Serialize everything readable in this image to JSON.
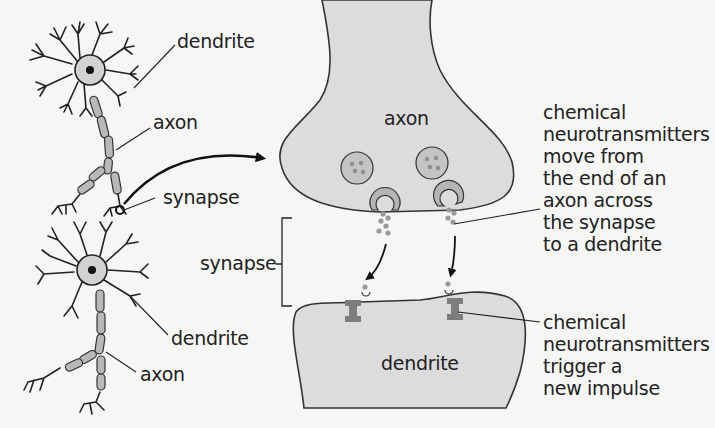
{
  "diagram": {
    "title_fragment": "",
    "labels": {
      "dendrite_top": "dendrite",
      "axon_top": "axon",
      "synapse_left": "synapse",
      "synapse_bracket": "synapse",
      "dendrite_bottom": "dendrite",
      "axon_bottom": "axon",
      "axon_terminal": "axon",
      "dendrite_terminal": "dendrite"
    },
    "annotations": [
      {
        "id": "release",
        "text": "chemical\nneurotransmitters\nmove from\nthe end of an\naxon across\nthe synapse\nto a dendrite"
      },
      {
        "id": "trigger",
        "text": "chemical\nneurotransmitters\ntrigger a\nnew impulse"
      }
    ],
    "colors": {
      "background": "#f6f6f4",
      "cell_fill": "#dcdcdc",
      "outline": "#333333",
      "vesicle_fill": "#c4c4c4",
      "vesicle_dot": "#8e8e8e",
      "receptor": "#7d7d7d",
      "soma_fill": "#d2d2d2",
      "text": "#222222"
    }
  }
}
